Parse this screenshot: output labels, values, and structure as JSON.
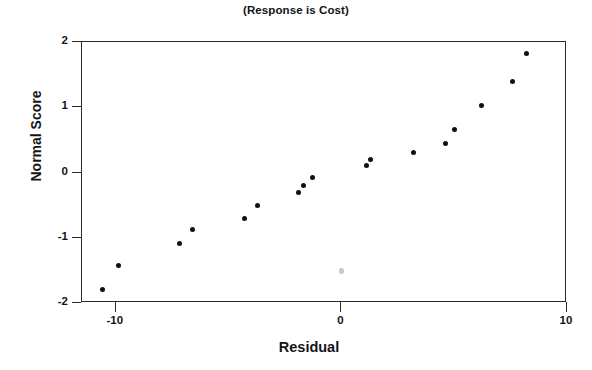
{
  "chart_data": {
    "type": "scatter",
    "title": "(Response is Cost)",
    "xlabel": "Residual",
    "ylabel": "Normal Score",
    "xlim": [
      -11.5,
      10.0
    ],
    "ylim": [
      -2.0,
      2.0
    ],
    "xticks": [
      -10,
      0,
      10
    ],
    "xtick_labels": [
      "-10",
      "0",
      "10"
    ],
    "yticks": [
      2,
      1,
      0,
      -1,
      -2
    ],
    "ytick_labels": [
      "2",
      "1",
      "0",
      "-1",
      "-2"
    ],
    "grid": false,
    "legend": null,
    "marker": "filled-circle",
    "marker_color": "#111111",
    "series": [
      {
        "name": "Normal probability plot of residuals",
        "points": [
          {
            "x": -10.6,
            "y": -1.79,
            "faint": false
          },
          {
            "x": -9.9,
            "y": -1.43,
            "faint": false
          },
          {
            "x": -7.2,
            "y": -1.09,
            "faint": false
          },
          {
            "x": -6.6,
            "y": -0.87,
            "faint": false
          },
          {
            "x": -4.3,
            "y": -0.7,
            "faint": false
          },
          {
            "x": -3.7,
            "y": -0.51,
            "faint": false
          },
          {
            "x": -1.9,
            "y": -0.31,
            "faint": false
          },
          {
            "x": -1.7,
            "y": -0.2,
            "faint": false
          },
          {
            "x": -1.3,
            "y": -0.08,
            "faint": false
          },
          {
            "x": 0.0,
            "y": -1.5,
            "faint": true
          },
          {
            "x": 1.1,
            "y": 0.11,
            "faint": false
          },
          {
            "x": 1.3,
            "y": 0.2,
            "faint": false
          },
          {
            "x": 3.2,
            "y": 0.31,
            "faint": false
          },
          {
            "x": 4.6,
            "y": 0.44,
            "faint": false
          },
          {
            "x": 5.0,
            "y": 0.66,
            "faint": false
          },
          {
            "x": 6.2,
            "y": 1.03,
            "faint": false
          },
          {
            "x": 7.6,
            "y": 1.39,
            "faint": false
          },
          {
            "x": 8.2,
            "y": 1.82,
            "faint": false
          }
        ]
      }
    ]
  },
  "colors": {
    "axis": "#2a2a2a",
    "text": "#141414",
    "marker": "#111111",
    "faint_marker": "#c9c9c9",
    "background": "#ffffff"
  }
}
